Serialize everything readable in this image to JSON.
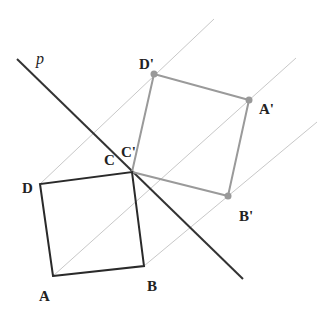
{
  "diagram": {
    "line_label": "p",
    "colors": {
      "original": "#2a2a2a",
      "image": "#9a9a9a",
      "guide": "#c4c4c4",
      "axis": "#333333"
    },
    "original_square": {
      "labels": {
        "A": "A",
        "B": "B",
        "C": "C",
        "D": "D"
      }
    },
    "image_square": {
      "labels": {
        "A": "A'",
        "B": "B'",
        "C": "C'",
        "D": "D'"
      }
    }
  }
}
